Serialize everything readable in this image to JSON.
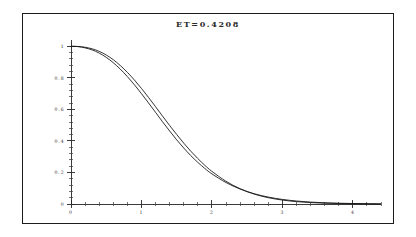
{
  "figure": {
    "title": "ET=0.4208",
    "background_color": "#ffffff",
    "frame_color": "#1c1c1c",
    "curve_color": "#111111",
    "axis_color": "#262626"
  },
  "chart_data": {
    "type": "line",
    "title": "ET=0.4208",
    "xlabel": "",
    "ylabel": "",
    "xlim": [
      0,
      4.4
    ],
    "ylim": [
      0,
      1.04
    ],
    "grid": false,
    "legend": null,
    "x_ticks_major": [
      0,
      1,
      2,
      3,
      4
    ],
    "x_tick_labels": [
      "0",
      "1",
      "2",
      "3",
      "4"
    ],
    "x_minor_per_major": 5,
    "y_ticks_major": [
      0,
      0.2,
      0.4,
      0.6,
      0.8,
      1
    ],
    "y_tick_labels": [
      "0",
      "0.2",
      "0.4",
      "0.6",
      "0.8",
      "1"
    ],
    "y_minor_per_major": 5,
    "x": [
      0,
      0.1,
      0.2,
      0.3,
      0.4,
      0.5,
      0.6,
      0.7,
      0.8,
      0.9,
      1.0,
      1.1,
      1.2,
      1.3,
      1.4,
      1.5,
      1.6,
      1.7,
      1.8,
      1.9,
      2.0,
      2.2,
      2.4,
      2.6,
      2.8,
      3.0,
      3.2,
      3.4,
      3.6,
      3.8,
      4.0,
      4.2,
      4.4
    ],
    "series": [
      {
        "name": "curve-upper",
        "values": [
          1.0,
          0.999,
          0.994,
          0.984,
          0.968,
          0.945,
          0.915,
          0.878,
          0.835,
          0.786,
          0.733,
          0.676,
          0.617,
          0.557,
          0.498,
          0.441,
          0.386,
          0.335,
          0.288,
          0.245,
          0.207,
          0.144,
          0.097,
          0.063,
          0.04,
          0.025,
          0.015,
          0.009,
          0.005,
          0.003,
          0.002,
          0.001,
          0.0
        ]
      },
      {
        "name": "curve-lower",
        "values": [
          1.0,
          0.998,
          0.99,
          0.977,
          0.957,
          0.93,
          0.896,
          0.855,
          0.808,
          0.756,
          0.7,
          0.641,
          0.581,
          0.521,
          0.463,
          0.407,
          0.355,
          0.307,
          0.264,
          0.225,
          0.191,
          0.136,
          0.095,
          0.065,
          0.044,
          0.029,
          0.019,
          0.012,
          0.008,
          0.005,
          0.003,
          0.002,
          0.001
        ]
      }
    ]
  }
}
